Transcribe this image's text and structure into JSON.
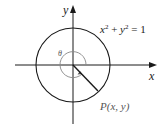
{
  "diagram": {
    "type": "unit-circle",
    "equation": {
      "x_term": "x",
      "x_exp": "2",
      "plus": " + ",
      "y_term": "y",
      "y_exp": "2",
      "rhs": " = 1"
    },
    "axes": {
      "x_label": "x",
      "y_label": "y"
    },
    "angle_label": "θ",
    "point_label": "P(x, y)",
    "colors": {
      "stroke": "#1a1a1a",
      "angle_arc": "#888888",
      "point_label": "#555555",
      "background": "#ffffff"
    }
  }
}
